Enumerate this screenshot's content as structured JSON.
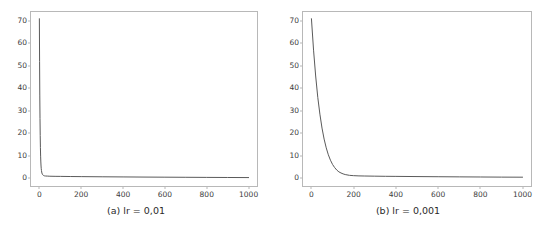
{
  "figure": {
    "background_color": "#ffffff",
    "line_color": "#5a5a5a",
    "spine_color": "#b8b8b8",
    "tick_label_color": "#3c3c3c",
    "caption_color": "#2b2b2b"
  },
  "panels": [
    {
      "id": "panel-a",
      "caption": "(a) lr = 0,01",
      "yticks": [
        "0",
        "10",
        "20",
        "30",
        "40",
        "50",
        "60",
        "70"
      ],
      "xticks": [
        "0",
        "200",
        "400",
        "600",
        "800",
        "1000"
      ]
    },
    {
      "id": "panel-b",
      "caption": "(b) lr = 0,001",
      "yticks": [
        "0",
        "10",
        "20",
        "30",
        "40",
        "50",
        "60",
        "70"
      ],
      "xticks": [
        "0",
        "200",
        "400",
        "600",
        "800",
        "1000"
      ]
    }
  ],
  "chart_data": [
    {
      "type": "line",
      "title": "(a) lr = 0,01",
      "xlabel": "",
      "ylabel": "",
      "xlim": [
        -40,
        1040
      ],
      "ylim": [
        -3.5,
        74
      ],
      "grid": false,
      "legend": null,
      "xticks": [
        0,
        200,
        400,
        600,
        800,
        1000
      ],
      "yticks": [
        0,
        10,
        20,
        30,
        40,
        50,
        60,
        70
      ],
      "series": [
        {
          "name": "loss",
          "color": "#5a5a5a",
          "x": [
            0,
            1,
            2,
            3,
            4,
            5,
            6,
            7,
            8,
            9,
            10,
            12,
            14,
            16,
            18,
            20,
            25,
            30,
            40,
            50,
            75,
            100,
            150,
            200,
            300,
            400,
            500,
            600,
            700,
            800,
            900,
            1000
          ],
          "y": [
            71.0,
            52.0,
            37.0,
            26.5,
            19.0,
            13.6,
            9.8,
            7.2,
            5.4,
            4.2,
            3.4,
            2.3,
            1.8,
            1.5,
            1.3,
            1.2,
            1.0,
            0.95,
            0.9,
            0.85,
            0.8,
            0.78,
            0.72,
            0.68,
            0.6,
            0.54,
            0.48,
            0.43,
            0.38,
            0.33,
            0.29,
            0.25
          ]
        }
      ]
    },
    {
      "type": "line",
      "title": "(b) lr = 0,001",
      "xlabel": "",
      "ylabel": "",
      "xlim": [
        -40,
        1040
      ],
      "ylim": [
        -3.5,
        74
      ],
      "grid": false,
      "legend": null,
      "xticks": [
        0,
        200,
        400,
        600,
        800,
        1000
      ],
      "yticks": [
        0,
        10,
        20,
        30,
        40,
        50,
        60,
        70
      ],
      "series": [
        {
          "name": "loss",
          "color": "#5a5a5a",
          "x": [
            0,
            10,
            20,
            30,
            40,
            50,
            60,
            70,
            80,
            90,
            100,
            110,
            120,
            130,
            140,
            150,
            160,
            180,
            200,
            225,
            250,
            300,
            350,
            400,
            500,
            600,
            700,
            800,
            900,
            1000
          ],
          "y": [
            71.0,
            57.0,
            45.5,
            36.0,
            28.5,
            22.3,
            17.4,
            13.5,
            10.4,
            8.0,
            6.1,
            4.7,
            3.6,
            2.8,
            2.3,
            1.9,
            1.6,
            1.25,
            1.1,
            1.0,
            0.95,
            0.88,
            0.82,
            0.78,
            0.7,
            0.63,
            0.57,
            0.51,
            0.46,
            0.42
          ]
        }
      ]
    }
  ]
}
